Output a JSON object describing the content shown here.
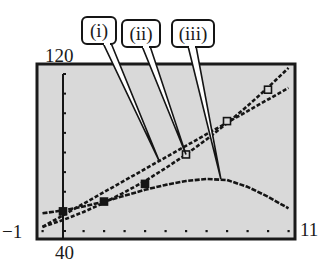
{
  "chart_data": {
    "type": "scatter",
    "title": "",
    "xlabel": "",
    "ylabel": "",
    "xlim": [
      -1,
      11
    ],
    "ylim": [
      40,
      120
    ],
    "xscale_step": 1,
    "yscale_step": 10,
    "grid": false,
    "legend": "none",
    "window_labels": {
      "xmin": "−1",
      "xmax": "11",
      "ymin": "40",
      "ymax": "120"
    },
    "points": {
      "x": [
        0,
        2,
        4,
        6,
        8,
        10
      ],
      "y": [
        50,
        55,
        64,
        79,
        96,
        112
      ]
    },
    "series": [
      {
        "name": "(i)",
        "kind": "linear",
        "x": [
          -1,
          0,
          1,
          2,
          3,
          4,
          5,
          6,
          7,
          8,
          9,
          10,
          11
        ],
        "y": [
          42.1,
          48.0,
          53.9,
          59.8,
          65.7,
          71.6,
          77.5,
          83.4,
          89.3,
          95.2,
          101.1,
          107.0,
          112.9
        ]
      },
      {
        "name": "(ii)",
        "kind": "quadratic",
        "x": [
          -1,
          0,
          1,
          2,
          3,
          4,
          5,
          6,
          7,
          8,
          9,
          10,
          11
        ],
        "y": [
          42.1,
          45.6,
          49.7,
          54.4,
          59.7,
          65.5,
          72.0,
          79.0,
          86.7,
          94.9,
          103.7,
          113.1,
          123.1
        ]
      },
      {
        "name": "(iii)",
        "kind": "concave-down",
        "x": [
          -1,
          0,
          1,
          2,
          3,
          4,
          5,
          6,
          7,
          8,
          9,
          10,
          11
        ],
        "y": [
          49,
          50.5,
          52.5,
          55,
          58,
          61,
          63.5,
          65.5,
          66.5,
          66,
          62.5,
          57.5,
          51.5
        ]
      }
    ],
    "callouts": [
      {
        "label": "(i)",
        "target_series": "(i)",
        "target": [
          4.7,
          75.5
        ]
      },
      {
        "label": "(ii)",
        "target_series": "(ii)",
        "target": [
          6,
          79
        ]
      },
      {
        "label": "(iii)",
        "target_series": "(iii)",
        "target": [
          7.7,
          66.5
        ]
      }
    ],
    "colors": {
      "screen": "#d9d9d9",
      "ink": "#151515",
      "frame": "#1a1a1a"
    }
  }
}
